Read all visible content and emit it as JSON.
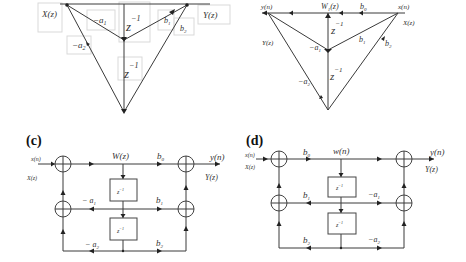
{
  "panels": {
    "a": {
      "labels": {
        "input": "X(z)",
        "output": "Y(z)",
        "coef_a1": "−a",
        "coef_a1_sub": "1",
        "coef_a2": "−a",
        "coef_a2_sub": "2",
        "coef_b1": "b",
        "coef_b1_sub": "1",
        "coef_b2": "b",
        "coef_b2_sub": "2",
        "delay1": "z",
        "delay1_sup": "−1",
        "delay2": "z",
        "delay2_sup": "−1"
      }
    },
    "b": {
      "labels": {
        "output_time": "y(n)",
        "output_z": "Y(z)",
        "node": "W",
        "node_sub": "1",
        "node_arg": "(z)",
        "coef_b0": "b",
        "coef_b0_sub": "0",
        "input_time": "x(n)",
        "input_z": "X(z)",
        "coef_b1": "b",
        "coef_b1_sub": "1",
        "coef_b2": "b",
        "coef_b2_sub": "2",
        "coef_a1": "−a",
        "coef_a1_sub": "1",
        "coef_a2": "−a",
        "coef_a2_sub": "2",
        "delay1": "z",
        "delay1_sup": "−1",
        "delay2": "z",
        "delay2_sup": "−1"
      }
    },
    "c": {
      "tag": "(c)",
      "labels": {
        "input_time": "x(n)",
        "input_z": "X(z)",
        "node": "W(z)",
        "coef_b0": "b",
        "coef_b0_sub": "0",
        "coef_b1": "b",
        "coef_b1_sub": "1",
        "coef_b2": "b",
        "coef_b2_sub": "2",
        "coef_a1": "− a",
        "coef_a1_sub": "1",
        "coef_a2": "− a",
        "coef_a2_sub": "2",
        "output_time": "y(n)",
        "output_z": "Y(z)",
        "delay1": "z",
        "delay1_sup": "−1",
        "delay2": "z",
        "delay2_sup": "−1"
      }
    },
    "d": {
      "tag": "(d)",
      "labels": {
        "input_time": "x(n)",
        "input_z": "X(z)",
        "node": "w(n)",
        "coef_b0": "b",
        "coef_b0_sub": "0",
        "coef_b1": "b",
        "coef_b1_sub": "1",
        "coef_b2": "b",
        "coef_b2_sub": "2",
        "coef_a1": "−a",
        "coef_a1_sub": "1",
        "coef_a2": "−a",
        "coef_a2_sub": "2",
        "output_time": "y(n)",
        "output_z": "Y(z)",
        "delay1": "z",
        "delay1_sup": "−1",
        "delay2": "z",
        "delay2_sup": "−1"
      }
    }
  }
}
